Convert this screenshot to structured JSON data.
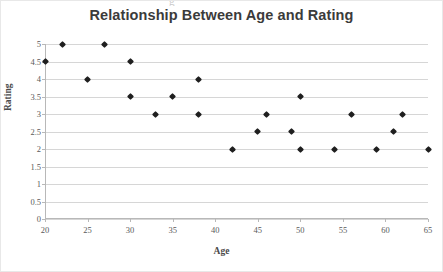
{
  "chart_data": {
    "type": "scatter",
    "title": "Relationship Between Age and Rating",
    "xlabel": "Age",
    "ylabel": "Rating",
    "xlim": [
      20,
      65
    ],
    "ylim": [
      0,
      5
    ],
    "xticks": [
      20,
      25,
      30,
      35,
      40,
      45,
      50,
      55,
      60,
      65
    ],
    "yticks": [
      0,
      0.5,
      1,
      1.5,
      2,
      2.5,
      3,
      3.5,
      4,
      4.5,
      5
    ],
    "xtick_labels": [
      "20",
      "25",
      "30",
      "35",
      "40",
      "45",
      "50",
      "55",
      "60",
      "65"
    ],
    "ytick_labels": [
      "0",
      "0.5",
      "1",
      "1.5",
      "2",
      "2.5",
      "3",
      "3.5",
      "4",
      "4.5",
      "5"
    ],
    "grid": "horizontal",
    "legend": null,
    "marker": "diamond",
    "marker_color": "#1f1f1f",
    "points": [
      {
        "x": 20,
        "y": 4.5
      },
      {
        "x": 22,
        "y": 5
      },
      {
        "x": 25,
        "y": 4
      },
      {
        "x": 27,
        "y": 5
      },
      {
        "x": 30,
        "y": 4.5
      },
      {
        "x": 30,
        "y": 3.5
      },
      {
        "x": 33,
        "y": 3
      },
      {
        "x": 35,
        "y": 3.5
      },
      {
        "x": 38,
        "y": 4
      },
      {
        "x": 38,
        "y": 3
      },
      {
        "x": 42,
        "y": 2
      },
      {
        "x": 45,
        "y": 2.5
      },
      {
        "x": 46,
        "y": 3
      },
      {
        "x": 49,
        "y": 2.5
      },
      {
        "x": 50,
        "y": 3.5
      },
      {
        "x": 50,
        "y": 2
      },
      {
        "x": 54,
        "y": 2
      },
      {
        "x": 56,
        "y": 3
      },
      {
        "x": 59,
        "y": 2
      },
      {
        "x": 61,
        "y": 2.5
      },
      {
        "x": 62,
        "y": 3
      },
      {
        "x": 65,
        "y": 2
      }
    ]
  },
  "artifact": {
    "top_text": "g"
  }
}
